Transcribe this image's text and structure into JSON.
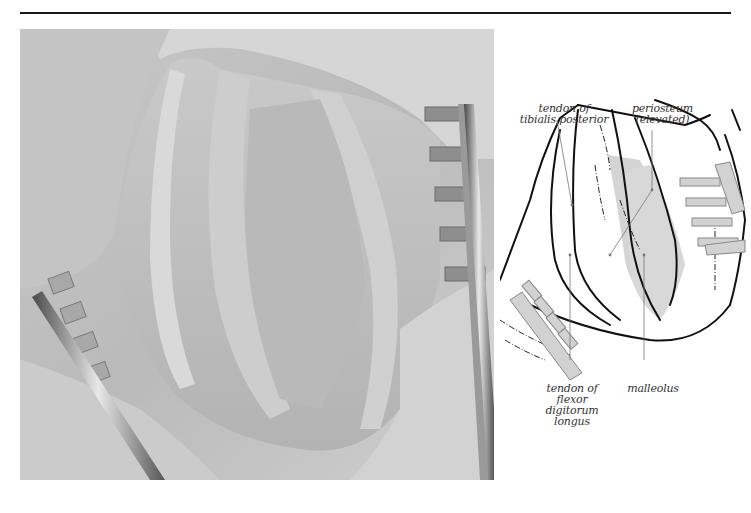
{
  "figure": {
    "type": "surgical photograph with labelled line drawing",
    "photo": {
      "subject": "surgical exposure with retractors",
      "tone": "greyscale"
    },
    "diagram": {
      "labels": [
        {
          "id": "tendon-tibialis-posterior",
          "lines": [
            "tendon of",
            "tibialis posterior"
          ]
        },
        {
          "id": "periosteum-elevated",
          "lines": [
            "periosteum",
            "(elevated)"
          ]
        },
        {
          "id": "tendon-flexor-digitorum-longus",
          "lines": [
            "tendon of",
            "flexor digitorum",
            "longus"
          ]
        },
        {
          "id": "malleolus",
          "lines": [
            "malleolus"
          ]
        }
      ]
    }
  },
  "colors": {
    "rule": "#1a1a1a",
    "shade": "#d4d4d4",
    "ink": "#111111",
    "leader": "#777777"
  }
}
